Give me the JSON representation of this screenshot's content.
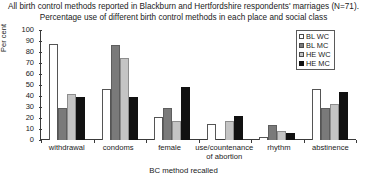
{
  "chart_data": {
    "type": "bar",
    "title": "All birth control methods reported in Blackburn and Hertfordshire respondents' marriages (N=71).",
    "subtitle": "Percentage use of different birth control methods in each place and social class",
    "xlabel": "BC method recalled",
    "ylabel": "Per cent",
    "ylim": [
      0,
      100
    ],
    "yticks": [
      0,
      10,
      20,
      30,
      40,
      50,
      60,
      70,
      80,
      90,
      100
    ],
    "grid": false,
    "legend_position": "top-right",
    "categories": [
      "withdrawal",
      "condoms",
      "female",
      "use/countenance of abortion",
      "rhythm",
      "abstinence"
    ],
    "series": [
      {
        "name": "BL WC",
        "color": "#ffffff",
        "values": [
          87,
          46,
          21,
          15,
          3,
          46
        ]
      },
      {
        "name": "BL MC",
        "color": "#7a7a7a",
        "values": [
          29,
          86,
          29,
          0,
          14,
          29
        ]
      },
      {
        "name": "HE WC",
        "color": "#c4c4c4",
        "values": [
          42,
          75,
          17,
          17,
          8,
          33
        ]
      },
      {
        "name": "HE MC",
        "color": "#111111",
        "values": [
          39,
          39,
          48,
          22,
          6,
          44
        ]
      }
    ]
  }
}
